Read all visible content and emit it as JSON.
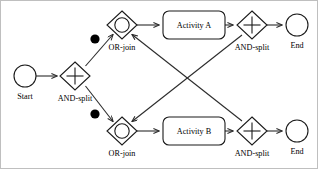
{
  "diagram": {
    "type": "workflow-petri-net",
    "title": "",
    "canvas": {
      "width": 318,
      "height": 169,
      "background": "#ffffff"
    },
    "colors": {
      "stroke": "#1a1a1a",
      "flow": "#2b2b2b",
      "token": "#000000",
      "node_fill": "#ffffff",
      "frame": "#bfbfbf"
    },
    "nodes": [
      {
        "id": "start",
        "shape": "circle",
        "label": "Start",
        "label_position": "below",
        "cx": 25,
        "cy": 76,
        "r": 11
      },
      {
        "id": "and-split-main",
        "shape": "diamond-plus",
        "label": "AND-split",
        "label_position": "below",
        "cx": 75,
        "cy": 76,
        "rx": 15,
        "ry": 14
      },
      {
        "id": "or-join-top",
        "shape": "diamond-circle",
        "label": "OR-join",
        "label_position": "below",
        "cx": 122,
        "cy": 25,
        "rx": 15,
        "ry": 14
      },
      {
        "id": "or-join-bottom",
        "shape": "diamond-circle",
        "label": "OR-join",
        "label_position": "below",
        "cx": 122,
        "cy": 131,
        "rx": 15,
        "ry": 14
      },
      {
        "id": "activity-a",
        "shape": "rounded-rect",
        "label": "Activity A",
        "label_position": "inside",
        "x": 163,
        "y": 10,
        "width": 62,
        "height": 28
      },
      {
        "id": "activity-b",
        "shape": "rounded-rect",
        "label": "Activity B",
        "label_position": "inside",
        "x": 163,
        "y": 117,
        "width": 62,
        "height": 28
      },
      {
        "id": "and-split-top",
        "shape": "diamond-plus",
        "label": "AND-split",
        "label_position": "below",
        "cx": 252,
        "cy": 25,
        "rx": 15,
        "ry": 14
      },
      {
        "id": "and-split-bottom",
        "shape": "diamond-plus",
        "label": "AND-split",
        "label_position": "below",
        "cx": 252,
        "cy": 131,
        "rx": 15,
        "ry": 14
      },
      {
        "id": "end-top",
        "shape": "circle",
        "label": "End",
        "label_position": "below",
        "cx": 297,
        "cy": 25,
        "r": 11
      },
      {
        "id": "end-bottom",
        "shape": "circle",
        "label": "End",
        "label_position": "below",
        "cx": 297,
        "cy": 131,
        "r": 11
      }
    ],
    "tokens": [
      {
        "id": "token-upper",
        "on_edge": "and-split-main-to-or-join-top",
        "cx": 95,
        "cy": 39,
        "r": 4.6
      },
      {
        "id": "token-lower",
        "on_edge": "and-split-main-to-or-join-bottom",
        "cx": 95,
        "cy": 114,
        "r": 4.6
      }
    ],
    "edges": [
      {
        "id": "start-to-and-split",
        "from": "start",
        "to": "and-split-main",
        "arrow": true
      },
      {
        "id": "and-split-main-to-or-join-top",
        "from": "and-split-main",
        "to": "or-join-top",
        "arrow": true
      },
      {
        "id": "and-split-main-to-or-join-bottom",
        "from": "and-split-main",
        "to": "or-join-bottom",
        "arrow": true
      },
      {
        "id": "or-join-top-to-activity-a",
        "from": "or-join-top",
        "to": "activity-a",
        "arrow": true
      },
      {
        "id": "or-join-bottom-to-activity-b",
        "from": "or-join-bottom",
        "to": "activity-b",
        "arrow": true
      },
      {
        "id": "activity-a-to-and-split-top",
        "from": "activity-a",
        "to": "and-split-top",
        "arrow": true
      },
      {
        "id": "activity-b-to-and-split-bottom",
        "from": "activity-b",
        "to": "and-split-bottom",
        "arrow": true
      },
      {
        "id": "and-split-top-to-end-top",
        "from": "and-split-top",
        "to": "end-top",
        "arrow": true
      },
      {
        "id": "and-split-bottom-to-end-bottom",
        "from": "and-split-bottom",
        "to": "end-bottom",
        "arrow": true
      },
      {
        "id": "and-split-top-to-or-join-bottom",
        "from": "and-split-top",
        "to": "or-join-bottom",
        "arrow": true,
        "style": "crossing-diagonal"
      },
      {
        "id": "and-split-bottom-to-or-join-top",
        "from": "and-split-bottom",
        "to": "or-join-top",
        "arrow": true,
        "style": "crossing-diagonal"
      }
    ],
    "labels": {
      "start": "Start",
      "and_split_main": "AND-split",
      "or_join_top": "OR-join",
      "or_join_bottom": "OR-join",
      "activity_a": "Activity A",
      "activity_b": "Activity B",
      "and_split_top": "AND-split",
      "and_split_bottom": "AND-split",
      "end_top": "End",
      "end_bottom": "End"
    }
  }
}
